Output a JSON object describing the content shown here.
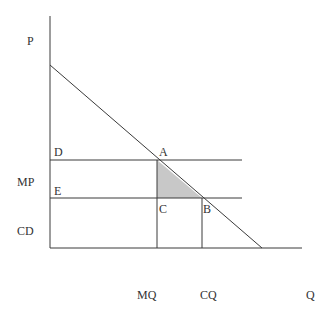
{
  "diagram": {
    "type": "economics-supply-demand",
    "axes": {
      "y_label": "P",
      "x_label": "Q"
    },
    "price_labels": [
      {
        "id": "mp",
        "text": "MP"
      },
      {
        "id": "cd",
        "text": "CD"
      }
    ],
    "quantity_labels": [
      {
        "id": "mq",
        "text": "MQ"
      },
      {
        "id": "cq",
        "text": "CQ"
      }
    ],
    "points": [
      {
        "id": "A",
        "text": "A"
      },
      {
        "id": "B",
        "text": "B"
      },
      {
        "id": "C",
        "text": "C"
      },
      {
        "id": "D",
        "text": "D"
      },
      {
        "id": "E",
        "text": "E"
      }
    ],
    "shaded_region": {
      "vertices": [
        "A",
        "C",
        "B"
      ],
      "fill": "#c8c8c8"
    },
    "colors": {
      "line": "#3a3a3a",
      "text": "#333333",
      "background": "#ffffff"
    }
  }
}
